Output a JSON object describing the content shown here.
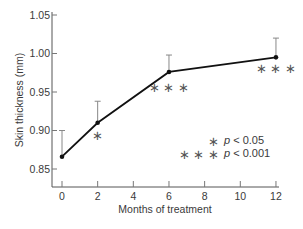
{
  "chart_data": {
    "type": "line",
    "title": "",
    "xlabel": "Months of treatment",
    "ylabel": "Skin thickness (mm)",
    "x": [
      0,
      2,
      6,
      12
    ],
    "series": [
      {
        "name": "Skin thickness",
        "values": [
          0.866,
          0.91,
          0.976,
          0.995
        ],
        "error_upper": [
          0.9,
          0.938,
          0.998,
          1.02
        ],
        "significance": [
          "",
          "*",
          "***",
          "***"
        ]
      }
    ],
    "xlim": [
      0,
      12
    ],
    "ylim": [
      0.83,
      1.05
    ],
    "xticks": [
      0,
      2,
      4,
      6,
      8,
      10,
      12
    ],
    "yticks": [
      0.85,
      0.9,
      0.95,
      1.0,
      1.05
    ],
    "ytick_labels": [
      "0.85",
      "0.90",
      "0.95",
      "1.00",
      "1.05"
    ],
    "grid": false,
    "legend": {
      "position": "inside-lower-right",
      "entries": [
        {
          "marker": "*",
          "text": "p < 0.05"
        },
        {
          "marker": "* * *",
          "text": "p < 0.001"
        }
      ]
    }
  },
  "labels": {
    "xlabel": "Months of treatment",
    "ylabel": "Skin thickness (mm)",
    "legend_p1": "p",
    "legend_v1": " < 0.05",
    "legend_p2": "p",
    "legend_v2": " < 0.001",
    "legend_m1": "∗",
    "legend_m2": "∗ ∗ ∗"
  }
}
